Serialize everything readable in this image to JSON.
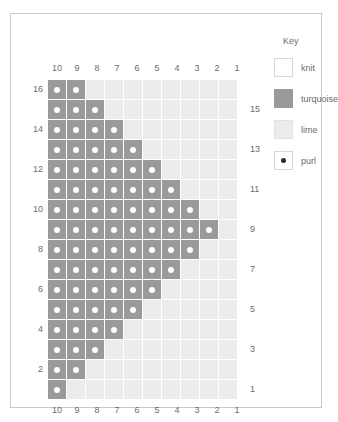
{
  "chart_data": {
    "type": "heatmap",
    "title": "",
    "columns": 10,
    "rows": 16,
    "column_labels_top": [
      "10",
      "9",
      "8",
      "7",
      "6",
      "5",
      "4",
      "3",
      "2",
      "1"
    ],
    "column_labels_bottom": [
      "10",
      "9",
      "8",
      "7",
      "6",
      "5",
      "4",
      "3",
      "2",
      "1"
    ],
    "row_labels_left": [
      "16",
      "",
      "14",
      "",
      "12",
      "",
      "10",
      "",
      "8",
      "",
      "6",
      "",
      "4",
      "",
      "2",
      ""
    ],
    "row_labels_right": [
      "",
      "15",
      "",
      "13",
      "",
      "11",
      "",
      "9",
      "",
      "7",
      "",
      "5",
      "",
      "3",
      "",
      "1"
    ],
    "cell_colors": {
      "turquoise": "#9a9a9a",
      "lime": "#ececec",
      "knit": "#ffffff",
      "purl_dot": "#ffffff",
      "grid_line": "#ffffff"
    },
    "legend_position": "right",
    "grid": [
      [
        1,
        1,
        0,
        0,
        0,
        0,
        0,
        0,
        0,
        0
      ],
      [
        1,
        1,
        1,
        0,
        0,
        0,
        0,
        0,
        0,
        0
      ],
      [
        1,
        1,
        1,
        1,
        0,
        0,
        0,
        0,
        0,
        0
      ],
      [
        1,
        1,
        1,
        1,
        1,
        0,
        0,
        0,
        0,
        0
      ],
      [
        1,
        1,
        1,
        1,
        1,
        1,
        0,
        0,
        0,
        0
      ],
      [
        1,
        1,
        1,
        1,
        1,
        1,
        1,
        0,
        0,
        0
      ],
      [
        1,
        1,
        1,
        1,
        1,
        1,
        1,
        1,
        0,
        0
      ],
      [
        1,
        1,
        1,
        1,
        1,
        1,
        1,
        1,
        1,
        0
      ],
      [
        1,
        1,
        1,
        1,
        1,
        1,
        1,
        1,
        0,
        0
      ],
      [
        1,
        1,
        1,
        1,
        1,
        1,
        1,
        0,
        0,
        0
      ],
      [
        1,
        1,
        1,
        1,
        1,
        1,
        0,
        0,
        0,
        0
      ],
      [
        1,
        1,
        1,
        1,
        1,
        0,
        0,
        0,
        0,
        0
      ],
      [
        1,
        1,
        1,
        1,
        0,
        0,
        0,
        0,
        0,
        0
      ],
      [
        1,
        1,
        1,
        0,
        0,
        0,
        0,
        0,
        0,
        0
      ],
      [
        1,
        1,
        0,
        0,
        0,
        0,
        0,
        0,
        0,
        0
      ],
      [
        1,
        0,
        0,
        0,
        0,
        0,
        0,
        0,
        0,
        0
      ]
    ],
    "row_numbers_top_to_bottom": [
      16,
      15,
      14,
      13,
      12,
      11,
      10,
      9,
      8,
      7,
      6,
      5,
      4,
      3,
      2,
      1
    ],
    "turquoise_count_per_row": {
      "16": 2,
      "15": 3,
      "14": 4,
      "13": 5,
      "12": 6,
      "11": 7,
      "10": 8,
      "9": 9,
      "8": 8,
      "7": 7,
      "6": 6,
      "5": 5,
      "4": 4,
      "3": 3,
      "2": 2,
      "1": 1
    }
  },
  "legend": {
    "title": "Key",
    "items": [
      {
        "label": "knit",
        "swatch": "knit",
        "icon": "white-square-icon"
      },
      {
        "label": "turquoise",
        "swatch": "turquoise",
        "icon": "gray-square-icon"
      },
      {
        "label": "lime",
        "swatch": "lime",
        "icon": "light-gray-square-icon"
      },
      {
        "label": "purl",
        "swatch": "purl",
        "icon": "dot-square-icon"
      }
    ]
  }
}
